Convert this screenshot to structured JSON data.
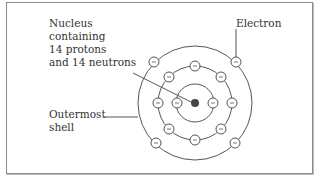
{
  "diagram": {
    "labels": {
      "nucleus": "Nucleus\ncontaining\n14 protons\nand 14 neutrons",
      "electron": "Electron",
      "outermost_shell": "Outermost\nshell"
    },
    "nucleus": {
      "protons": 14,
      "neutrons": 14,
      "color": "#444444"
    },
    "shells": [
      {
        "name": "inner",
        "electrons": 2
      },
      {
        "name": "middle",
        "electrons": 8
      },
      {
        "name": "outermost",
        "electrons": 4
      }
    ],
    "electron_symbol": "−",
    "colors": {
      "line": "#555555",
      "text": "#333333",
      "frame": "#8a8a8a"
    }
  }
}
